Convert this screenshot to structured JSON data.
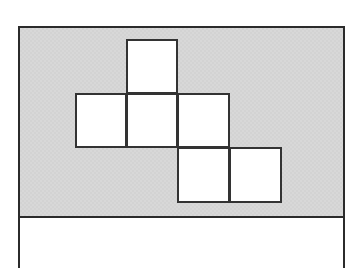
{
  "figure": {
    "kind": "polyomino-net-diagram",
    "square_count": 6,
    "grid": {
      "columns": 4,
      "rows": 3,
      "cell_size": 51,
      "origin_x": 75,
      "origin_y": 39,
      "column_x": [
        75,
        126,
        177,
        229
      ],
      "row_y": [
        39,
        93,
        147,
        202
      ]
    },
    "colors": {
      "panel_fill": "#d8d8d8",
      "square_fill": "#ffffff",
      "stroke": "#333333",
      "panel_stroke": "#2b2b2b",
      "page_background": "#ffffff"
    },
    "shaded_panel": {
      "name": "shaded-panel",
      "x": 18,
      "y": 26,
      "width": 327,
      "height": 192
    },
    "page_frame": {
      "name": "page-frame",
      "x": 18,
      "y": 216,
      "width": 327,
      "height": 52
    },
    "squares": [
      {
        "id": "square-r1c2",
        "row": 1,
        "col": 2,
        "x": 126,
        "y": 39,
        "width": 52,
        "height": 55
      },
      {
        "id": "square-r2c1",
        "row": 2,
        "col": 1,
        "x": 75,
        "y": 93,
        "width": 52,
        "height": 55
      },
      {
        "id": "square-r2c2",
        "row": 2,
        "col": 2,
        "x": 126,
        "y": 93,
        "width": 52,
        "height": 55
      },
      {
        "id": "square-r2c3",
        "row": 2,
        "col": 3,
        "x": 177,
        "y": 93,
        "width": 53,
        "height": 55
      },
      {
        "id": "square-r3c3",
        "row": 3,
        "col": 3,
        "x": 177,
        "y": 147,
        "width": 53,
        "height": 56
      },
      {
        "id": "square-r3c4",
        "row": 3,
        "col": 4,
        "x": 229,
        "y": 147,
        "width": 53,
        "height": 56
      }
    ]
  }
}
